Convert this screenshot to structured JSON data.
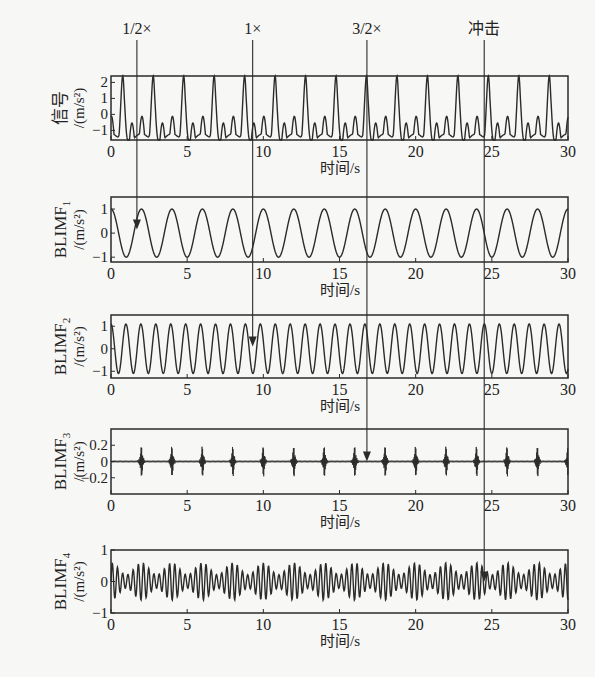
{
  "figure": {
    "x_axis_label": "时间/s",
    "annotations": [
      {
        "label": "1/2×",
        "x_time": 1.7,
        "ends_at_panel": 1
      },
      {
        "label": "1×",
        "x_time": 9.3,
        "ends_at_panel": 2
      },
      {
        "label": "3/2×",
        "x_time": 16.8,
        "ends_at_panel": 3
      },
      {
        "label": "冲击",
        "x_time": 24.5,
        "ends_at_panel": 4
      }
    ]
  },
  "chart_data": [
    {
      "type": "line",
      "title": "",
      "ylabel_main": "信号",
      "ylabel_sub": "",
      "ylabel_unit": "/(m/s²)",
      "xlabel": "时间/s",
      "xlim": [
        0,
        30
      ],
      "ylim": [
        -1.6,
        2.4
      ],
      "xticks": [
        0,
        5,
        10,
        15,
        20,
        25,
        30
      ],
      "yticks": [
        -1,
        0,
        1,
        2
      ],
      "description": "Composite signal: sum of 1/2×, 1×, 3/2× components plus impulses; peaks ≈2.3 every ~2 s, troughs ≈-1.5",
      "components": {
        "half_freq_hz": 0.5,
        "one_freq_hz": 1.0,
        "impulse_period_s": 2.0
      },
      "grid": false
    },
    {
      "type": "line",
      "ylabel_main": "BLIMF",
      "ylabel_sub": "1",
      "ylabel_unit": "/(m/s²)",
      "xlabel": "时间/s",
      "xlim": [
        0,
        30
      ],
      "ylim": [
        -1.2,
        1.5
      ],
      "xticks": [
        0,
        5,
        10,
        15,
        20,
        25,
        30
      ],
      "yticks": [
        -1,
        0,
        1
      ],
      "description": "Sinusoid, amplitude 1, period ≈2 s (0.5 Hz)",
      "amplitude": 1.0,
      "frequency_hz": 0.5,
      "grid": false
    },
    {
      "type": "line",
      "ylabel_main": "BLIMF",
      "ylabel_sub": "2",
      "ylabel_unit": "/(m/s²)",
      "xlabel": "时间/s",
      "xlim": [
        0,
        30
      ],
      "ylim": [
        -1.3,
        1.5
      ],
      "xticks": [
        0,
        5,
        10,
        15,
        20,
        25,
        30
      ],
      "yticks": [
        -1,
        0,
        1
      ],
      "description": "Sinusoid, amplitude ≈1.1, period ≈1 s (1 Hz)",
      "amplitude": 1.1,
      "frequency_hz": 1.0,
      "grid": false
    },
    {
      "type": "line",
      "ylabel_main": "BLIMF",
      "ylabel_sub": "3",
      "ylabel_unit": "/(m/s²)",
      "xlabel": "时间/s",
      "xlim": [
        0,
        30
      ],
      "ylim": [
        -0.4,
        0.4
      ],
      "xticks": [
        0,
        5,
        10,
        15,
        20,
        25,
        30
      ],
      "yticks": [
        -0.2,
        0,
        0.2
      ],
      "description": "Impulse bursts, peak ≈±0.25, every ≈2 s starting near 2 s",
      "impulse_times": [
        2,
        4,
        6,
        8,
        10,
        12,
        14,
        16,
        18,
        20,
        22,
        24,
        26,
        28,
        30
      ],
      "impulse_amplitude": 0.25,
      "grid": false
    },
    {
      "type": "line",
      "ylabel_main": "BLIMF",
      "ylabel_sub": "4",
      "ylabel_unit": "/(m/s²)",
      "xlabel": "时间/s",
      "xlim": [
        0,
        30
      ],
      "ylim": [
        -1,
        1
      ],
      "xticks": [
        0,
        5,
        10,
        15,
        20,
        25,
        30
      ],
      "yticks": [
        -1,
        0,
        1
      ],
      "description": "Oscillation ≈1.5 Hz, amplitude ≈0.6, modulated with deeper troughs every ~2 s",
      "amplitude": 0.6,
      "frequency_hz": 1.5,
      "grid": false
    }
  ]
}
